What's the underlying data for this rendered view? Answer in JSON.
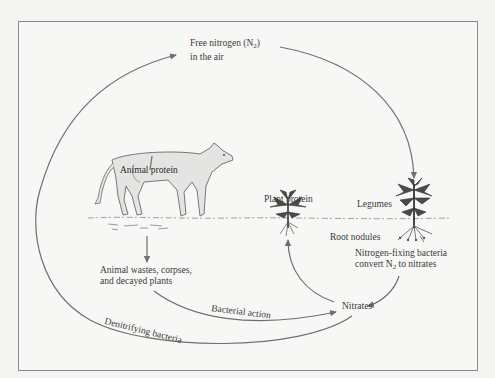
{
  "diagram": {
    "colors": {
      "background": "#f4f4f2",
      "frame": "#8a8a8a",
      "arrow": "#6f6f6f",
      "text": "#3a3a3a",
      "ground": "#9a9a9a",
      "animal_fill": "#e6e6e4",
      "plant_fill": "#4a4a4a"
    },
    "labels": {
      "free_nitrogen_line1_prefix": "Free nitrogen (N",
      "free_nitrogen_line1_sub": "2",
      "free_nitrogen_line1_suffix": ")",
      "free_nitrogen_line2": "in the air",
      "animal_protein": "Animal protein",
      "plant_protein": "Plant protein",
      "legumes": "Legumes",
      "root_nodules": "Root nodules",
      "nitrogen_fixing_line1": "Nitrogen-fixing bacteria",
      "nitrogen_fixing_line2_prefix": "convert N",
      "nitrogen_fixing_line2_sub": "2",
      "nitrogen_fixing_line2_suffix": " to nitrates",
      "animal_wastes_line1": "Animal wastes, corpses,",
      "animal_wastes_line2": "and decayed plants",
      "nitrates": "Nitrates",
      "bacterial_action": "Bacterial action",
      "denitrifying_bacteria": "Denitrifying bacteria"
    },
    "nodes": [
      {
        "id": "free-nitrogen",
        "label": "Free nitrogen (N2) in the air"
      },
      {
        "id": "legumes",
        "label": "Legumes"
      },
      {
        "id": "plant-protein",
        "label": "Plant protein"
      },
      {
        "id": "animal-protein",
        "label": "Animal protein"
      },
      {
        "id": "animal-wastes",
        "label": "Animal wastes, corpses, and decayed plants"
      },
      {
        "id": "nitrates",
        "label": "Nitrates"
      }
    ],
    "edges": [
      {
        "from": "free-nitrogen",
        "to": "legumes",
        "label": ""
      },
      {
        "from": "legumes",
        "to": "nitrates",
        "label": "Nitrogen-fixing bacteria convert N2 to nitrates"
      },
      {
        "from": "nitrates",
        "to": "plant-protein",
        "label": ""
      },
      {
        "from": "animal-protein",
        "to": "animal-wastes",
        "label": ""
      },
      {
        "from": "animal-wastes",
        "to": "nitrates",
        "label": "Bacterial action"
      },
      {
        "from": "nitrates",
        "to": "free-nitrogen",
        "label": "Denitrifying bacteria"
      }
    ]
  }
}
